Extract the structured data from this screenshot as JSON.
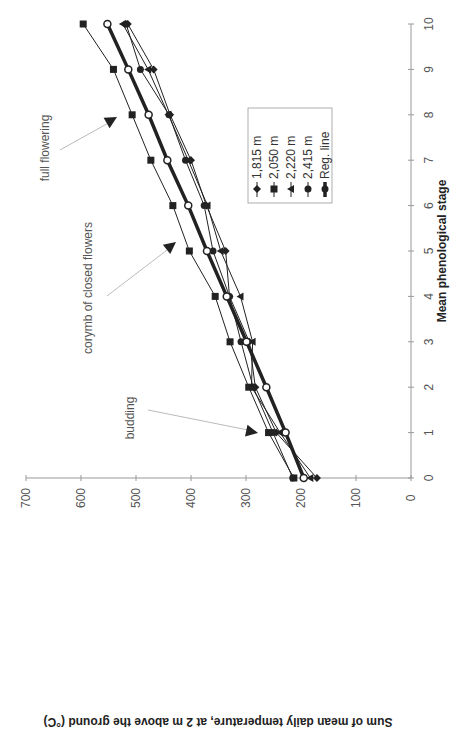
{
  "chart_data": {
    "type": "line",
    "orientation": "rotated-90-ccw",
    "title": "",
    "xlabel": "Mean phenological stage",
    "ylabel": "Sum of mean daily temperature, at 2 m above the ground (°C)",
    "x": [
      0,
      1,
      2,
      3,
      4,
      5,
      6,
      7,
      8,
      9,
      10
    ],
    "x_ticks": [
      "0",
      "1",
      "2",
      "3",
      "4",
      "5",
      "6",
      "7",
      "8",
      "9",
      "10"
    ],
    "y_ticks": [
      "0",
      "100",
      "200",
      "300",
      "400",
      "500",
      "600",
      "700"
    ],
    "xlim": [
      0,
      10
    ],
    "ylim": [
      0,
      700
    ],
    "grid": false,
    "legend_position": "inside-right",
    "series": [
      {
        "name": "1,815 m",
        "marker": "diamond",
        "values": [
          171,
          245,
          283,
          294,
          330,
          337,
          372,
          400,
          438,
          468,
          515
        ]
      },
      {
        "name": "2,050 m",
        "marker": "square",
        "values": [
          213,
          259,
          295,
          329,
          356,
          403,
          433,
          473,
          507,
          541,
          596
        ]
      },
      {
        "name": "2,220 m",
        "marker": "triangle",
        "values": [
          183,
          238,
          290,
          288,
          310,
          346,
          370,
          405,
          441,
          478,
          524
        ]
      },
      {
        "name": "2,415 m",
        "marker": "circle",
        "values": [
          215,
          251,
          287,
          309,
          330,
          360,
          376,
          410,
          440,
          492,
          518
        ]
      },
      {
        "name": "Reg. line",
        "marker": "open-circle",
        "thick": true,
        "values": [
          195,
          228,
          263,
          299,
          335,
          371,
          405,
          443,
          477,
          514,
          552
        ]
      }
    ],
    "annotations": [
      {
        "text": "budding",
        "stage": 1
      },
      {
        "text": "corymb of closed flowers",
        "stage": 5
      },
      {
        "text": "full flowering",
        "stage": 8
      }
    ]
  },
  "colors": {
    "axis": "#999999",
    "series": "#222222",
    "arrow": "#bbbbbb"
  }
}
